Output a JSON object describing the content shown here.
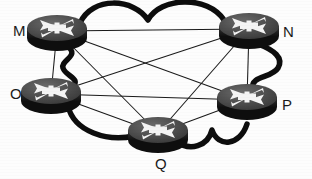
{
  "diagram": {
    "type": "network-topology",
    "device_icon": "router-icon",
    "colors": {
      "background": "#fdfdfd",
      "node_body": "#4a4a4a",
      "node_body_dark": "#2b2b2b",
      "node_top": "#555555",
      "node_symbol": "#f2f2f2",
      "thick_link": "#0d0d0d",
      "thin_link": "#1a1a1a",
      "label_text": "#1a1a1a"
    },
    "nodes": [
      {
        "id": "M",
        "label": "M",
        "x": 57,
        "y": 31,
        "label_x": 13,
        "label_y": 23
      },
      {
        "id": "N",
        "label": "N",
        "x": 249,
        "y": 29,
        "label_x": 283,
        "label_y": 24
      },
      {
        "id": "O",
        "label": "O",
        "x": 51,
        "y": 94,
        "label_x": 10,
        "label_y": 86
      },
      {
        "id": "P",
        "label": "P",
        "x": 247,
        "y": 100,
        "label_x": 282,
        "label_y": 97
      },
      {
        "id": "Q",
        "label": "Q",
        "x": 158,
        "y": 133,
        "label_x": 155,
        "label_y": 156
      }
    ],
    "thick_links": [
      {
        "from": "M",
        "to": "N",
        "style": "double-arch"
      },
      {
        "from": "M",
        "to": "O",
        "style": "serpentine"
      },
      {
        "from": "N",
        "to": "P",
        "style": "serpentine"
      },
      {
        "from": "O",
        "to": "Q",
        "style": "arc"
      },
      {
        "from": "Q",
        "to": "P",
        "style": "double-arch"
      }
    ],
    "thin_links": [
      {
        "from": "M",
        "to": "N"
      },
      {
        "from": "M",
        "to": "O"
      },
      {
        "from": "M",
        "to": "P"
      },
      {
        "from": "M",
        "to": "Q"
      },
      {
        "from": "N",
        "to": "O"
      },
      {
        "from": "N",
        "to": "P"
      },
      {
        "from": "N",
        "to": "Q"
      },
      {
        "from": "O",
        "to": "P"
      },
      {
        "from": "O",
        "to": "Q"
      },
      {
        "from": "P",
        "to": "Q"
      }
    ]
  }
}
